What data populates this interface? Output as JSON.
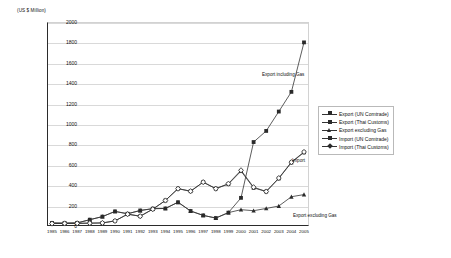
{
  "chart_data": {
    "type": "line",
    "title": "",
    "xlabel": "",
    "ylabel": "(US $ Million)",
    "ylim": [
      0,
      2000
    ],
    "ytick_step": 200,
    "grid": true,
    "legend_position": "right",
    "yticks": [
      "0",
      "200",
      "400",
      "600",
      "800",
      "1000",
      "1200",
      "1400",
      "1600",
      "1800",
      "2000"
    ],
    "categories": [
      "1985",
      "1986",
      "1987",
      "1988",
      "1989",
      "1990",
      "1991",
      "1992",
      "1993",
      "1994",
      "1995",
      "1996",
      "1997",
      "1998",
      "1999",
      "2000",
      "2001",
      "2002",
      "2003",
      "2004",
      "2005"
    ],
    "series": [
      {
        "name": "Export (UN Comtrade)",
        "marker": "square",
        "values": [
          30,
          28,
          30,
          62,
          92,
          143,
          120,
          152,
          170,
          172,
          233,
          147,
          104,
          78,
          131,
          276,
          823,
          932,
          1122,
          1315,
          1800
        ]
      },
      {
        "name": "Export (Thai Customs)",
        "marker": "square",
        "values": [
          null,
          null,
          null,
          null,
          null,
          null,
          null,
          null,
          null,
          null,
          null,
          null,
          null,
          null,
          null,
          538,
          null,
          null,
          null,
          null,
          null
        ]
      },
      {
        "name": "Export excluding Gas",
        "marker": "triangle",
        "values": [
          30,
          28,
          30,
          62,
          92,
          143,
          120,
          152,
          170,
          172,
          233,
          147,
          104,
          78,
          131,
          160,
          150,
          172,
          196,
          287,
          308
        ]
      },
      {
        "name": "Import (UN Comtrade)",
        "marker": "square",
        "values": [
          24,
          25,
          26,
          28,
          30,
          50,
          116,
          96,
          165,
          250,
          366,
          341,
          430,
          366,
          411,
          538,
          374,
          338,
          466,
          622,
          722
        ]
      },
      {
        "name": "Import (Thai Customs)",
        "marker": "diamond",
        "values": [
          24,
          25,
          26,
          28,
          30,
          50,
          116,
          96,
          165,
          250,
          366,
          341,
          430,
          366,
          415,
          546,
          380,
          338,
          470,
          626,
          726
        ]
      }
    ],
    "annotations": [
      {
        "text": "Export including Gas",
        "x_px": 262,
        "y_px": 72
      },
      {
        "text": "Import",
        "x_px": 292,
        "y_px": 158
      },
      {
        "text": "Export excluding Gas",
        "x_px": 293,
        "y_px": 213
      }
    ],
    "legend_entries": [
      {
        "label": "Export (UN Comtrade)",
        "marker": "square"
      },
      {
        "label": "Export (Thai Customs)",
        "marker": "square"
      },
      {
        "label": "Export excluding Gas",
        "marker": "triangle"
      },
      {
        "label": "Import (UN Comtrade)",
        "marker": "square"
      },
      {
        "label": "Import (Thai Customs)",
        "marker": "diamond"
      }
    ]
  }
}
